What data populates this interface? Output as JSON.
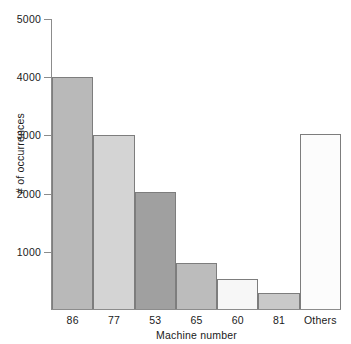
{
  "chart_data": {
    "type": "bar",
    "title": "",
    "xlabel": "Machine number",
    "ylabel": "# of occurrences",
    "categories": [
      "86",
      "77",
      "53",
      "65",
      "60",
      "81",
      "Others"
    ],
    "values": [
      4000,
      3000,
      2030,
      800,
      530,
      290,
      3030
    ],
    "bar_colors": [
      "#b9b9b9",
      "#d4d4d4",
      "#a0a0a0",
      "#bcbcbc",
      "#f7f7f7",
      "#c9c9c9",
      "#fcfcfc"
    ],
    "bar_border_color": "#7d7d7d",
    "ylim": [
      0,
      5000
    ],
    "yticks": [
      1000,
      2000,
      3000,
      4000,
      5000
    ],
    "ytick_labels": [
      "1000",
      "2000",
      "3000",
      "4000",
      "5000"
    ],
    "grid": false,
    "legend": "none",
    "axis_color": "#8c8c8c",
    "background": "#ffffff"
  }
}
